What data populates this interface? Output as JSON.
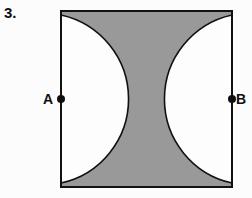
{
  "figure": {
    "problem_number": "3.",
    "canvas": {
      "width": 252,
      "height": 198,
      "background": "#fcfcfc"
    },
    "square": {
      "name": "outer-square",
      "left": 61,
      "top": 11,
      "right": 232,
      "bottom": 187,
      "width": 171,
      "height": 176,
      "stroke": "#111111",
      "stroke_width": 2,
      "fill": "#999999"
    },
    "shaded_region": {
      "description": "region of square outside the two semicircles",
      "fill": "#999999"
    },
    "unshaded_region": {
      "description": "two semicircles meeting at the center of the square",
      "fill": "#fdfdfd"
    },
    "semicircles": [
      {
        "name": "left-semicircle",
        "center_label": "A",
        "cx": 61,
        "cy": 99,
        "radius": 86,
        "opens": "right"
      },
      {
        "name": "right-semicircle",
        "center_label": "B",
        "cx": 232,
        "cy": 99,
        "radius": 86,
        "opens": "left"
      }
    ],
    "cusp": {
      "x": 146.5,
      "y": 99
    },
    "points": [
      {
        "id": "A",
        "label": "A",
        "cx": 61,
        "cy": 99,
        "radius": 4,
        "fill": "#0f0f0f",
        "label_side": "left"
      },
      {
        "id": "B",
        "label": "B",
        "cx": 232,
        "cy": 99,
        "radius": 4,
        "fill": "#0f0f0f",
        "label_side": "right"
      }
    ],
    "colors": {
      "ink": "#0f0f0f",
      "stroke": "#111111",
      "shade": "#999999",
      "paper": "#fdfdfd",
      "background": "#fcfcfc"
    }
  }
}
